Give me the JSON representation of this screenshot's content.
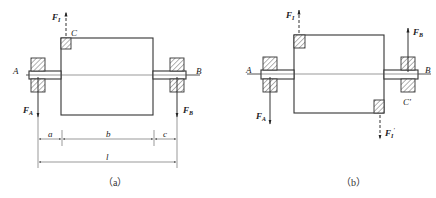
{
  "figure": {
    "panels": [
      {
        "id": "a",
        "caption": "（a）",
        "labels": {
          "left_support": "A",
          "right_support": "B",
          "mass_point": "C",
          "force_top": "F",
          "force_top_sub": "I",
          "force_left": "F",
          "force_left_sub": "A",
          "force_right": "F",
          "force_right_sub": "B"
        },
        "dimensions": {
          "a": "a",
          "b": "b",
          "c": "c",
          "l": "l"
        }
      },
      {
        "id": "b",
        "caption": "（b）",
        "labels": {
          "left_support": "A",
          "right_support": "B",
          "mass_point": "C'",
          "force_top": "F",
          "force_top_sub": "I",
          "force_bottom": "F",
          "force_bottom_sub": "I",
          "force_bottom_prime": "'",
          "force_left": "F",
          "force_left_sub": "A",
          "force_right": "F",
          "force_right_sub": "B"
        }
      }
    ]
  }
}
